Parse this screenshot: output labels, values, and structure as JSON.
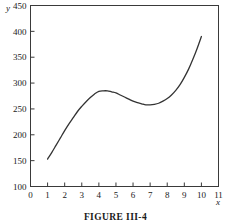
{
  "figure": {
    "caption": "FIGURE III-4"
  },
  "chart_data": {
    "type": "line",
    "title": "",
    "subtitle": "",
    "xlabel": "x",
    "ylabel": "y",
    "xlim": [
      0,
      11
    ],
    "ylim": [
      100,
      450
    ],
    "xticks": [
      0,
      1,
      2,
      3,
      4,
      5,
      6,
      7,
      8,
      9,
      10,
      11
    ],
    "xtick_labels": [
      "0",
      "1",
      "2",
      "3",
      "4",
      "5",
      "6",
      "7",
      "8",
      "9",
      "10",
      "11"
    ],
    "yticks": [
      100,
      150,
      200,
      250,
      300,
      350,
      400,
      450
    ],
    "ytick_labels": [
      "100",
      "150",
      "200",
      "250",
      "300",
      "350",
      "400",
      "450"
    ],
    "grid": false,
    "legend": null,
    "line_color": "#333333",
    "line_width": 1.3,
    "annotations": [],
    "series": [
      {
        "name": "cubic",
        "x": [
          1.0,
          1.25,
          1.5,
          1.75,
          2.0,
          2.25,
          2.5,
          2.75,
          3.0,
          3.25,
          3.5,
          3.75,
          4.0,
          4.25,
          4.5,
          4.75,
          5.0,
          5.25,
          5.5,
          5.75,
          6.0,
          6.25,
          6.5,
          6.75,
          7.0,
          7.25,
          7.5,
          7.75,
          8.0,
          8.25,
          8.5,
          8.75,
          9.0,
          9.25,
          9.5,
          9.75,
          10.0
        ],
        "values": [
          153,
          166,
          180,
          194,
          208,
          221,
          233,
          245,
          255,
          264,
          272,
          279,
          284,
          285,
          285,
          283,
          281,
          277,
          273,
          269,
          265,
          262,
          260,
          258,
          258,
          259,
          261,
          265,
          270,
          277,
          286,
          297,
          311,
          327,
          346,
          367,
          390
        ]
      }
    ],
    "key_points": {
      "start": {
        "x": 1,
        "y": 153
      },
      "local_max": {
        "x": 4,
        "y": 285
      },
      "local_min": {
        "x": 7,
        "y": 258
      },
      "end": {
        "x": 10,
        "y": 390
      }
    }
  }
}
